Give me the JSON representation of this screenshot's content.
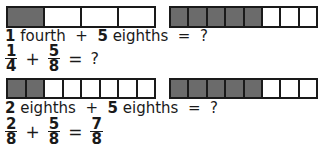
{
  "problems": [
    {
      "bars": [
        {
          "parts": 4,
          "shaded": 1
        },
        {
          "parts": 8,
          "shaded": 5
        }
      ],
      "words": {
        "n1": "1",
        "w1": "fourth",
        "plus": "+",
        "n2": "5",
        "w2": "eighths",
        "eq": "=",
        "ans": "?"
      },
      "equation": {
        "a": {
          "num": "1",
          "den": "4"
        },
        "plus": "+",
        "b": {
          "num": "5",
          "den": "8"
        },
        "eq": "=",
        "answer": "?"
      }
    },
    {
      "bars": [
        {
          "parts": 8,
          "shaded": 2
        },
        {
          "parts": 8,
          "shaded": 5
        }
      ],
      "words": {
        "n1": "2",
        "w1": "eighths",
        "plus": "+",
        "n2": "5",
        "w2": "eighths",
        "eq": "=",
        "ans": "?"
      },
      "equation": {
        "a": {
          "num": "2",
          "den": "8"
        },
        "plus": "+",
        "b": {
          "num": "5",
          "den": "8"
        },
        "eq": "=",
        "answer_num": "7",
        "answer_den": "8"
      }
    }
  ],
  "colors": {
    "shaded": "#6b6b6b",
    "outline": "#1a1a1a"
  }
}
